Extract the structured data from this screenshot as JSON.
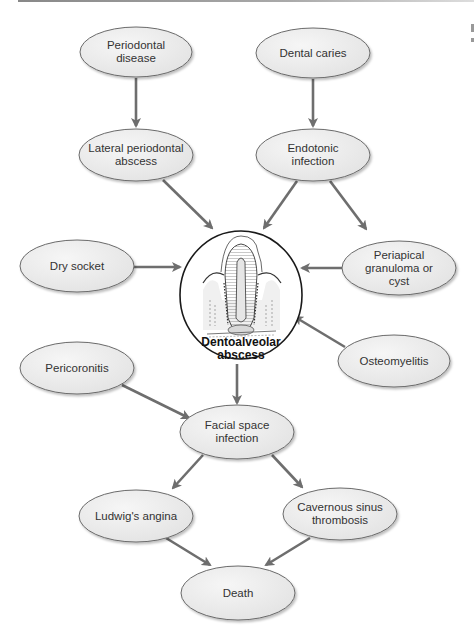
{
  "diagram": {
    "type": "flowchart",
    "center_node": {
      "id": "dentoalveolar_abscess",
      "label": "Dentoalveolar\nabscess",
      "illustration": "tooth-cross-section-icon"
    },
    "nodes": [
      {
        "id": "periodontal_disease",
        "label": "Periodontal\ndisease"
      },
      {
        "id": "dental_caries",
        "label": "Dental caries"
      },
      {
        "id": "lateral_periodontal_abscess",
        "label": "Lateral periodontal\nabscess"
      },
      {
        "id": "endotonic_infection",
        "label": "Endotonic\ninfection"
      },
      {
        "id": "dry_socket",
        "label": "Dry socket"
      },
      {
        "id": "periapical_granuloma",
        "label": "Periapical\ngranuloma or cyst"
      },
      {
        "id": "osteomyelitis",
        "label": "Osteomyelitis"
      },
      {
        "id": "pericoronitis",
        "label": "Pericoronitis"
      },
      {
        "id": "facial_space_infection",
        "label": "Facial space\ninfection"
      },
      {
        "id": "ludwigs_angina",
        "label": "Ludwig's angina"
      },
      {
        "id": "cavernous_sinus_thrombosis",
        "label": "Cavernous sinus\nthrombosis"
      },
      {
        "id": "death",
        "label": "Death"
      }
    ],
    "edges": [
      {
        "from": "periodontal_disease",
        "to": "lateral_periodontal_abscess"
      },
      {
        "from": "dental_caries",
        "to": "endotonic_infection"
      },
      {
        "from": "lateral_periodontal_abscess",
        "to": "dentoalveolar_abscess"
      },
      {
        "from": "endotonic_infection",
        "to": "dentoalveolar_abscess"
      },
      {
        "from": "endotonic_infection",
        "to": "periapical_granuloma"
      },
      {
        "from": "dry_socket",
        "to": "dentoalveolar_abscess"
      },
      {
        "from": "periapical_granuloma",
        "to": "dentoalveolar_abscess"
      },
      {
        "from": "osteomyelitis",
        "to": "dentoalveolar_abscess"
      },
      {
        "from": "dentoalveolar_abscess",
        "to": "facial_space_infection"
      },
      {
        "from": "pericoronitis",
        "to": "facial_space_infection"
      },
      {
        "from": "facial_space_infection",
        "to": "ludwigs_angina"
      },
      {
        "from": "facial_space_infection",
        "to": "cavernous_sinus_thrombosis"
      },
      {
        "from": "ludwigs_angina",
        "to": "death"
      },
      {
        "from": "cavernous_sinus_thrombosis",
        "to": "death"
      }
    ],
    "colors": {
      "node_fill": "#ececec",
      "node_stroke": "#6a6a6a",
      "arrow": "#6e6e6e",
      "center_stroke": "#1a1a1a",
      "text": "#333333"
    }
  }
}
